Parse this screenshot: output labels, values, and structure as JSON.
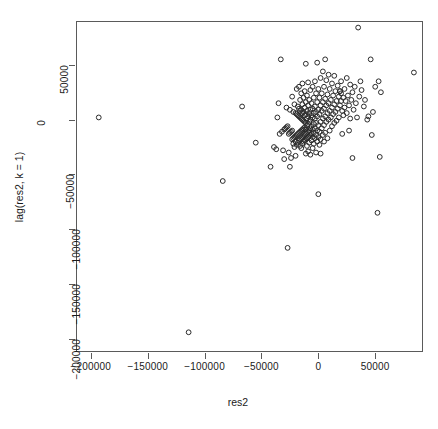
{
  "chart_data": {
    "type": "scatter",
    "title": "",
    "xlabel": "res2",
    "ylabel": "lag(res2, k = 1)",
    "xlim": [
      -213000,
      92000
    ],
    "ylim": [
      -212000,
      90000
    ],
    "xticks": [
      -200000,
      -150000,
      -100000,
      -50000,
      0,
      50000
    ],
    "xticklabels": [
      "-200000",
      "-150000",
      "-100000",
      "-50000",
      "0",
      "50000"
    ],
    "yticks": [
      50000,
      0,
      -50000,
      -100000,
      -150000,
      -200000
    ],
    "yticklabels": [
      "50000",
      "0",
      "-50000",
      "-100000",
      "-150000",
      "-200000"
    ],
    "grid": false,
    "legend": null,
    "marker": "open-circle",
    "marker_color": "#2b2b2b",
    "n_points": 176,
    "points": [
      [
        -193000,
        2000
      ],
      [
        -114000,
        -194000
      ],
      [
        -84000,
        -56000
      ],
      [
        -67000,
        12000
      ],
      [
        -55000,
        -21000
      ],
      [
        -42000,
        -43000
      ],
      [
        -39000,
        -25000
      ],
      [
        -37000,
        -27000
      ],
      [
        -36000,
        2000
      ],
      [
        -35000,
        15000
      ],
      [
        -34000,
        -13000
      ],
      [
        -33000,
        55000
      ],
      [
        -32000,
        -11000
      ],
      [
        -31000,
        -28000
      ],
      [
        -30000,
        -9000
      ],
      [
        -30000,
        -36000
      ],
      [
        -29000,
        -8000
      ],
      [
        -28000,
        11000
      ],
      [
        -28000,
        -7000
      ],
      [
        -27000,
        -117000
      ],
      [
        -27000,
        -6000
      ],
      [
        -26000,
        -13000
      ],
      [
        -26000,
        -30000
      ],
      [
        -25000,
        9000
      ],
      [
        -25000,
        -12000
      ],
      [
        -25000,
        -43000
      ],
      [
        -24000,
        -11000
      ],
      [
        -24000,
        -35000
      ],
      [
        -23000,
        21000
      ],
      [
        -23000,
        -10000
      ],
      [
        -23000,
        -18000
      ],
      [
        -22000,
        7000
      ],
      [
        -22000,
        -17000
      ],
      [
        -22000,
        -22000
      ],
      [
        -21000,
        14000
      ],
      [
        -21000,
        -16000
      ],
      [
        -21000,
        -25000
      ],
      [
        -20000,
        6000
      ],
      [
        -20000,
        -15000
      ],
      [
        -20000,
        -20000
      ],
      [
        -20000,
        -33000
      ],
      [
        -19000,
        28000
      ],
      [
        -19000,
        5000
      ],
      [
        -19000,
        -14000
      ],
      [
        -19000,
        -23000
      ],
      [
        -18000,
        12000
      ],
      [
        -18000,
        4000
      ],
      [
        -18000,
        -13000
      ],
      [
        -18000,
        -21000
      ],
      [
        -17000,
        30000
      ],
      [
        -17000,
        10000
      ],
      [
        -17000,
        3000
      ],
      [
        -17000,
        -12000
      ],
      [
        -17000,
        -19000
      ],
      [
        -16000,
        18000
      ],
      [
        -16000,
        8000
      ],
      [
        -16000,
        2000
      ],
      [
        -16000,
        -11000
      ],
      [
        -16000,
        -18000
      ],
      [
        -16000,
        -24000
      ],
      [
        -15000,
        24000
      ],
      [
        -15000,
        9000
      ],
      [
        -15000,
        1000
      ],
      [
        -15000,
        -10000
      ],
      [
        -15000,
        -17000
      ],
      [
        -15000,
        -26000
      ],
      [
        -14000,
        33000
      ],
      [
        -14000,
        14000
      ],
      [
        -14000,
        6000
      ],
      [
        -14000,
        0
      ],
      [
        -14000,
        -9000
      ],
      [
        -14000,
        -16000
      ],
      [
        -14000,
        -22000
      ],
      [
        -13000,
        20000
      ],
      [
        -13000,
        7000
      ],
      [
        -13000,
        -1000
      ],
      [
        -13000,
        -8000
      ],
      [
        -13000,
        -15000
      ],
      [
        -13000,
        -20000
      ],
      [
        -12000,
        26000
      ],
      [
        -12000,
        11000
      ],
      [
        -12000,
        4000
      ],
      [
        -12000,
        -2000
      ],
      [
        -12000,
        -7000
      ],
      [
        -12000,
        -14000
      ],
      [
        -12000,
        -19000
      ],
      [
        -11000,
        51000
      ],
      [
        -11000,
        16000
      ],
      [
        -11000,
        5000
      ],
      [
        -11000,
        -3000
      ],
      [
        -11000,
        -9000
      ],
      [
        -11000,
        -13000
      ],
      [
        -11000,
        -18000
      ],
      [
        -11000,
        -31000
      ],
      [
        -10000,
        22000
      ],
      [
        -10000,
        8000
      ],
      [
        -10000,
        1000
      ],
      [
        -10000,
        -5000
      ],
      [
        -10000,
        -12000
      ],
      [
        -10000,
        -17000
      ],
      [
        -10000,
        -24000
      ],
      [
        -9000,
        34000
      ],
      [
        -9000,
        13000
      ],
      [
        -9000,
        3000
      ],
      [
        -9000,
        -4000
      ],
      [
        -9000,
        -11000
      ],
      [
        -9000,
        -16000
      ],
      [
        -9000,
        -29000
      ],
      [
        -8000,
        18000
      ],
      [
        -8000,
        6000
      ],
      [
        -8000,
        -2000
      ],
      [
        -8000,
        -10000
      ],
      [
        -8000,
        -15000
      ],
      [
        -8000,
        -21000
      ],
      [
        -7000,
        27000
      ],
      [
        -7000,
        9000
      ],
      [
        -7000,
        0
      ],
      [
        -7000,
        -8000
      ],
      [
        -7000,
        -14000
      ],
      [
        -7000,
        -32000
      ],
      [
        -6000,
        15000
      ],
      [
        -6000,
        4000
      ],
      [
        -6000,
        -6000
      ],
      [
        -6000,
        -13000
      ],
      [
        -6000,
        -19000
      ],
      [
        -5000,
        30000
      ],
      [
        -5000,
        10000
      ],
      [
        -5000,
        2000
      ],
      [
        -5000,
        -9000
      ],
      [
        -5000,
        -16000
      ],
      [
        -5000,
        -26000
      ],
      [
        -4000,
        20000
      ],
      [
        -4000,
        6000
      ],
      [
        -4000,
        -4000
      ],
      [
        -4000,
        -12000
      ],
      [
        -4000,
        -22000
      ],
      [
        -3000,
        35000
      ],
      [
        -3000,
        12000
      ],
      [
        -3000,
        1000
      ],
      [
        -3000,
        -8000
      ],
      [
        -3000,
        -17000
      ],
      [
        -2000,
        24000
      ],
      [
        -2000,
        7000
      ],
      [
        -2000,
        -3000
      ],
      [
        -2000,
        -14000
      ],
      [
        -2000,
        -30000
      ],
      [
        -1000,
        52000
      ],
      [
        -1000,
        16000
      ],
      [
        -1000,
        3000
      ],
      [
        -1000,
        -10000
      ],
      [
        -1000,
        -20000
      ],
      [
        0,
        28000
      ],
      [
        0,
        9000
      ],
      [
        0,
        -5000
      ],
      [
        0,
        -16000
      ],
      [
        0,
        -68000
      ],
      [
        1000,
        20000
      ],
      [
        1000,
        5000
      ],
      [
        1000,
        -11000
      ],
      [
        1000,
        -23000
      ],
      [
        2000,
        38000
      ],
      [
        2000,
        13000
      ],
      [
        2000,
        -2000
      ],
      [
        2000,
        -18000
      ],
      [
        2000,
        -31000
      ],
      [
        3000,
        24000
      ],
      [
        3000,
        8000
      ],
      [
        3000,
        -8000
      ],
      [
        4000,
        44000
      ],
      [
        4000,
        16000
      ],
      [
        4000,
        1000
      ],
      [
        4000,
        -14000
      ],
      [
        5000,
        30000
      ],
      [
        5000,
        10000
      ],
      [
        5000,
        -5000
      ],
      [
        5000,
        -20000
      ],
      [
        6000,
        55000
      ],
      [
        6000,
        19000
      ],
      [
        6000,
        3000
      ],
      [
        6000,
        -12000
      ],
      [
        7000,
        36000
      ],
      [
        7000,
        13000
      ],
      [
        7000,
        -2000
      ],
      [
        8000,
        23000
      ],
      [
        8000,
        6000
      ],
      [
        8000,
        -17000
      ],
      [
        9000,
        41000
      ],
      [
        9000,
        15000
      ],
      [
        9000,
        0
      ],
      [
        10000,
        28000
      ],
      [
        10000,
        8000
      ],
      [
        10000,
        -10000
      ],
      [
        11000,
        18000
      ],
      [
        11000,
        2000
      ],
      [
        12000,
        33000
      ],
      [
        12000,
        11000
      ],
      [
        12000,
        -6000
      ],
      [
        13000,
        22000
      ],
      [
        13000,
        5000
      ],
      [
        14000,
        40000
      ],
      [
        14000,
        14000
      ],
      [
        14000,
        -3000
      ],
      [
        15000,
        26000
      ],
      [
        15000,
        7000
      ],
      [
        16000,
        17000
      ],
      [
        16000,
        -1000
      ],
      [
        17000,
        31000
      ],
      [
        17000,
        10000
      ],
      [
        18000,
        21000
      ],
      [
        18000,
        2000
      ],
      [
        19000,
        26000
      ],
      [
        19000,
        26000
      ],
      [
        19000,
        13000
      ],
      [
        20000,
        35000
      ],
      [
        20000,
        17000
      ],
      [
        20000,
        24000
      ],
      [
        21000,
        8000
      ],
      [
        21000,
        -13000
      ],
      [
        22000,
        20000
      ],
      [
        22000,
        4000
      ],
      [
        23000,
        28000
      ],
      [
        23000,
        11000
      ],
      [
        24000,
        17000
      ],
      [
        25000,
        38000
      ],
      [
        25000,
        6000
      ],
      [
        26000,
        22000
      ],
      [
        27000,
        13000
      ],
      [
        27000,
        -10000
      ],
      [
        28000,
        32000
      ],
      [
        28000,
        1000
      ],
      [
        29000,
        18000
      ],
      [
        30000,
        25000
      ],
      [
        30000,
        -35000
      ],
      [
        31000,
        9000
      ],
      [
        32000,
        30000
      ],
      [
        33000,
        15000
      ],
      [
        34000,
        2000
      ],
      [
        35000,
        84000
      ],
      [
        36000,
        21000
      ],
      [
        37000,
        35000
      ],
      [
        38000,
        27000
      ],
      [
        40000,
        12000
      ],
      [
        41000,
        18000
      ],
      [
        43000,
        0
      ],
      [
        44000,
        3000
      ],
      [
        46000,
        55000
      ],
      [
        47000,
        -14000
      ],
      [
        48000,
        7000
      ],
      [
        50000,
        30000
      ],
      [
        52000,
        -85000
      ],
      [
        53000,
        35000
      ],
      [
        54000,
        -34000
      ],
      [
        55000,
        25000
      ],
      [
        84000,
        43000
      ]
    ]
  }
}
